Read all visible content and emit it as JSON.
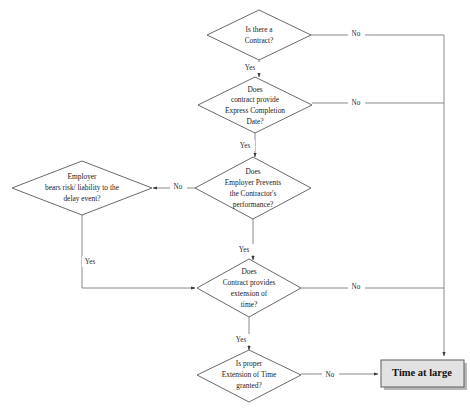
{
  "diagram": {
    "background_color": "#ffffff",
    "line_color": "#7d7d80",
    "node_fill": "#ffffff",
    "node_stroke": "#59595c",
    "terminal_fill": "#e2e2e2",
    "terminal_shadow": "#b8b8b8"
  },
  "nodes": {
    "d1": {
      "type": "decision",
      "lines": [
        "Is there a",
        "Contract?"
      ],
      "cx": 259,
      "cy": 35,
      "rx": 52,
      "ry": 25
    },
    "d2": {
      "type": "decision",
      "lines": [
        "Does",
        "contract provide",
        "Express Completion",
        "Date?"
      ],
      "cx": 255,
      "cy": 105,
      "rx": 57,
      "ry": 28
    },
    "d3": {
      "type": "decision",
      "lines": [
        "Does",
        "Employer Prevents",
        "the Contractor's",
        "performance?"
      ],
      "cx": 253,
      "cy": 188,
      "rx": 58,
      "ry": 31
    },
    "d4": {
      "type": "decision",
      "lines": [
        "Does",
        "Contract provides",
        "extension of",
        "time?"
      ],
      "cx": 249,
      "cy": 288,
      "rx": 52,
      "ry": 29
    },
    "d5": {
      "type": "decision",
      "lines": [
        "Is proper",
        "Extension of Time",
        "granted?"
      ],
      "cx": 249,
      "cy": 377,
      "rx": 52,
      "ry": 27
    },
    "d6": {
      "type": "decision",
      "lines": [
        "Employer",
        "bears risk/ liability to the",
        "delay event?"
      ],
      "cx": 82,
      "cy": 188,
      "rx": 70,
      "ry": 27
    },
    "terminal": {
      "type": "terminal",
      "label": "Time at large",
      "x": 381,
      "y": 360,
      "w": 83,
      "h": 27
    }
  },
  "edges": [
    {
      "name": "d1-no",
      "label": "No",
      "lx": 356,
      "ly": 34
    },
    {
      "name": "d1-yes",
      "label": "Yes",
      "lx": 250,
      "ly": 68
    },
    {
      "name": "d2-no",
      "label": "No",
      "lx": 356,
      "ly": 103
    },
    {
      "name": "d2-yes",
      "label": "Yes",
      "lx": 245,
      "ly": 146
    },
    {
      "name": "d3-no",
      "label": "No",
      "lx": 178,
      "ly": 187
    },
    {
      "name": "d3-yes",
      "label": "Yes",
      "lx": 244,
      "ly": 250
    },
    {
      "name": "d4-no",
      "label": "No",
      "lx": 356,
      "ly": 287
    },
    {
      "name": "d4-yes",
      "label": "Yes",
      "lx": 241,
      "ly": 340
    },
    {
      "name": "d5-no",
      "label": "No",
      "lx": 330,
      "ly": 376
    },
    {
      "name": "d6-yes",
      "label": "Yes",
      "lx": 90,
      "ly": 262
    }
  ]
}
